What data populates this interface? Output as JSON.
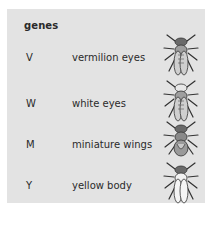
{
  "title": "genes",
  "genes": [
    {
      "symbol": "V",
      "description": "vermilion eyes",
      "icon": "fly-vermilion-eyes-icon",
      "eye_color": "#5a5a5a",
      "body_fill": "#bdbdbd",
      "wing_style": "long"
    },
    {
      "symbol": "W",
      "description": "white eyes",
      "icon": "fly-white-eyes-icon",
      "eye_color": "#e8e8e8",
      "body_fill": "#bdbdbd",
      "wing_style": "long"
    },
    {
      "symbol": "M",
      "description": "miniature wings",
      "icon": "fly-miniature-wings-icon",
      "eye_color": "#5a5a5a",
      "body_fill": "#9a9a9a",
      "wing_style": "short"
    },
    {
      "symbol": "Y",
      "description": "yellow body",
      "icon": "fly-yellow-body-icon",
      "eye_color": "#5a5a5a",
      "body_fill": "#f0f0f0",
      "wing_style": "long"
    }
  ]
}
